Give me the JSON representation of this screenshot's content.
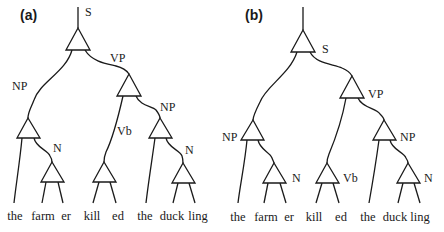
{
  "panels": [
    {
      "id": "a",
      "label": "(a)",
      "node_labels": {
        "S": "S",
        "VP": "VP",
        "NP_subject": "NP",
        "N_farmer": "N",
        "Vb": "Vb",
        "NP_object": "NP",
        "N_duckling": "N"
      },
      "label_placement": "on-branch",
      "words": [
        "the",
        "farm",
        "er",
        "kill",
        "ed",
        "the",
        "duck",
        "ling"
      ]
    },
    {
      "id": "b",
      "label": "(b)",
      "node_labels": {
        "S": "S",
        "VP": "VP",
        "NP_subject": "NP",
        "N_farmer": "N",
        "Vb": "Vb",
        "NP_object": "NP",
        "N_duckling": "N"
      },
      "label_placement": "beside-node",
      "words": [
        "the",
        "farm",
        "er",
        "kill",
        "ed",
        "the",
        "duck",
        "ling"
      ]
    }
  ]
}
